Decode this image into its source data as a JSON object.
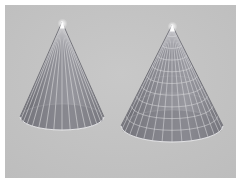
{
  "figure": {
    "background_color": "#ffffff",
    "panel_color": "#c2c2c2",
    "panel": {
      "x": 5,
      "y": 5,
      "width": 231,
      "height": 173
    }
  },
  "chart_data": {
    "type": "scatter",
    "title": "",
    "subtitle": "",
    "xlabel": "",
    "ylabel": "",
    "grid": false,
    "legend_position": "none",
    "axis_visible": false,
    "tick_labels": [],
    "annotations": [],
    "series": [
      {
        "name": "cone-left",
        "label": "Left cone (radial wireframe)",
        "mesh_style": "radial-only",
        "apex": {
          "x": 57,
          "y": 17
        },
        "base_center": {
          "x": 57,
          "y": 112
        },
        "base_radius_x": 42,
        "base_radius_y": 13,
        "height": 95,
        "radial_divisions": 16,
        "ring_divisions": 0,
        "surface_color": "#8a8a90",
        "shade_dark": "#6b6b72",
        "shade_light": "#a2a2a8",
        "mesh_color": "#e0e0e2",
        "apex_highlight": "#f2f2f2"
      },
      {
        "name": "cone-right",
        "label": "Right cone (full mesh wireframe)",
        "mesh_style": "radial-and-rings",
        "apex": {
          "x": 167,
          "y": 20
        },
        "base_center": {
          "x": 167,
          "y": 121
        },
        "base_radius_x": 51,
        "base_radius_y": 16,
        "height": 101,
        "radial_divisions": 16,
        "ring_divisions": 9,
        "surface_color": "#8a8a90",
        "shade_dark": "#6b6b72",
        "shade_light": "#a2a2a8",
        "mesh_color": "#e0e0e2",
        "apex_highlight": "#f2f2f2"
      }
    ],
    "colors": {
      "panel": "#c2c2c2",
      "surface": "#8a8a90",
      "mesh": "#e0e0e2",
      "shadow": "#6b6b72",
      "highlight": "#a2a2a8"
    }
  }
}
